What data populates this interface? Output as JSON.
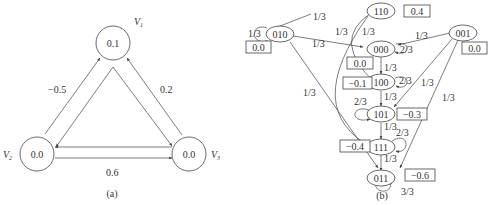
{
  "panel_a": {
    "caption": "(a)",
    "nodes": [
      {
        "id": "V1",
        "label": "V",
        "sub": "1",
        "value": "0.1"
      },
      {
        "id": "V2",
        "label": "V",
        "sub": "2",
        "value": "0.0"
      },
      {
        "id": "V3",
        "label": "V",
        "sub": "3",
        "value": "0.0"
      }
    ],
    "edges": [
      {
        "pair": "V1-V2",
        "weight": "−0.5"
      },
      {
        "pair": "V1-V3",
        "weight": "0.2"
      },
      {
        "pair": "V2-V3",
        "weight": "0.6"
      }
    ]
  },
  "panel_b": {
    "caption": "(b)",
    "states": [
      {
        "id": "110",
        "energy": "0.4"
      },
      {
        "id": "010",
        "energy": "0.0"
      },
      {
        "id": "000",
        "energy": "0.0"
      },
      {
        "id": "001",
        "energy": "0.0"
      },
      {
        "id": "100",
        "energy": "−0.1"
      },
      {
        "id": "101",
        "energy": "−0.3"
      },
      {
        "id": "111",
        "energy": "−0.4"
      },
      {
        "id": "011",
        "energy": "−0.6"
      }
    ],
    "transitions": [
      {
        "from": "110",
        "to": "010",
        "p": "1/3"
      },
      {
        "from": "110",
        "to": "100",
        "p": "1/3"
      },
      {
        "from": "110",
        "to": "111",
        "p": "1/3"
      },
      {
        "from": "010",
        "to": "010",
        "p": "1/3"
      },
      {
        "from": "010",
        "to": "000",
        "p": "1/3"
      },
      {
        "from": "010",
        "to": "011",
        "p": "1/3"
      },
      {
        "from": "001",
        "to": "000",
        "p": "1/3"
      },
      {
        "from": "001",
        "to": "101",
        "p": "1/3"
      },
      {
        "from": "001",
        "to": "011",
        "p": "1/3"
      },
      {
        "from": "000",
        "to": "000",
        "p": "2/3"
      },
      {
        "from": "000",
        "to": "100",
        "p": "1/3"
      },
      {
        "from": "100",
        "to": "100",
        "p": "2/3"
      },
      {
        "from": "100",
        "to": "101",
        "p": "1/3"
      },
      {
        "from": "101",
        "to": "101",
        "p": "2/3"
      },
      {
        "from": "101",
        "to": "111",
        "p": "1/3"
      },
      {
        "from": "111",
        "to": "111",
        "p": "2/3"
      },
      {
        "from": "111",
        "to": "011",
        "p": "1/3"
      },
      {
        "from": "011",
        "to": "011",
        "p": "3/3"
      }
    ]
  }
}
